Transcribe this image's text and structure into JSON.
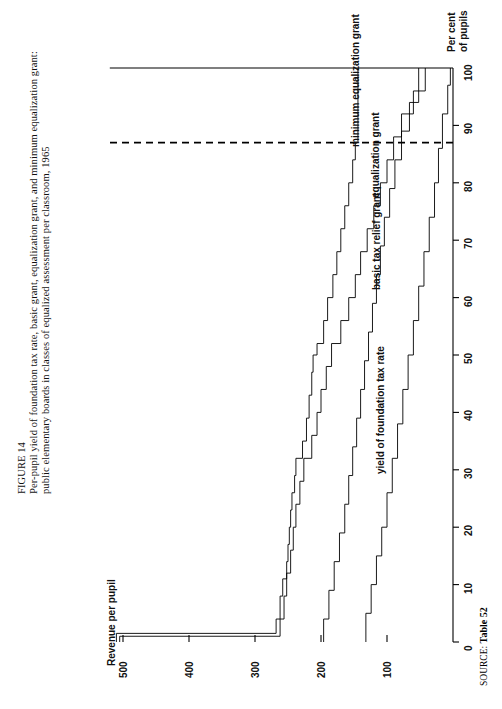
{
  "figure": {
    "number": "FIGURE 14",
    "caption_line_1": "Per-pupil yield of foundation tax rate, basic grant, equalization grant, and minimum equalization grant:",
    "caption_line_2": "public elementary boards in classes of equalized assessment per classroom, 1965",
    "source_label": "SOURCE:",
    "source_value": "Table 52"
  },
  "chart_data": {
    "type": "line",
    "title": "Per-pupil yield of foundation tax rate, basic grant, equalization grant, and minimum equalization grant: public elementary boards in classes of equalized assessment per classroom, 1965",
    "xlabel": "Per cent of pupils",
    "ylabel": "Revenue per pupil",
    "xlim": [
      0,
      100
    ],
    "ylim": [
      0,
      520
    ],
    "xticks": [
      0,
      10,
      20,
      30,
      40,
      50,
      60,
      70,
      80,
      90,
      100
    ],
    "xtick_labels": [
      "0",
      "10",
      "20",
      "30",
      "40",
      "50",
      "60",
      "70",
      "80",
      "90",
      "100"
    ],
    "yticks": [
      100,
      200,
      300,
      400,
      500
    ],
    "ytick_labels": [
      "100",
      "200",
      "300",
      "400",
      "500"
    ],
    "grid": false,
    "legend_position": "inline-annotations",
    "orientation": "rotated-90-ccw",
    "annotations": [
      {
        "text": "minimum equalization grant",
        "x": 87,
        "y": 150
      },
      {
        "text": "equalization grant",
        "x": 78,
        "y": 120
      },
      {
        "text": "basic tax relief grant",
        "x": 62,
        "y": 118
      },
      {
        "text": "yield of foundation tax rate",
        "x": 30,
        "y": 112
      }
    ],
    "reference_line": {
      "orientation": "vertical",
      "x": 87,
      "style": "dashed",
      "label": "minimum equalization grant cut-off"
    },
    "series": [
      {
        "name": "minimum equalization grant",
        "step": "post",
        "points": [
          [
            0,
            510
          ],
          [
            1.5,
            510
          ],
          [
            1.5,
            268
          ],
          [
            4.0,
            268
          ],
          [
            4.0,
            262
          ],
          [
            8.0,
            262
          ],
          [
            8.0,
            258
          ],
          [
            11.0,
            258
          ],
          [
            11.0,
            252
          ],
          [
            14.0,
            252
          ],
          [
            14.0,
            250
          ],
          [
            17.0,
            250
          ],
          [
            17.0,
            248
          ],
          [
            20.0,
            248
          ],
          [
            20.0,
            246
          ],
          [
            23.0,
            246
          ],
          [
            23.0,
            244
          ],
          [
            26.0,
            244
          ],
          [
            26.0,
            240
          ],
          [
            29.0,
            240
          ],
          [
            29.0,
            238
          ],
          [
            32.0,
            238
          ],
          [
            32.0,
            228
          ],
          [
            35.0,
            228
          ],
          [
            35.0,
            222
          ],
          [
            39.0,
            222
          ],
          [
            39.0,
            218
          ],
          [
            43.0,
            218
          ],
          [
            43.0,
            214
          ],
          [
            47.0,
            214
          ],
          [
            47.0,
            212
          ],
          [
            50.0,
            212
          ],
          [
            50.0,
            206
          ],
          [
            52.0,
            206
          ],
          [
            52.0,
            196
          ],
          [
            56.0,
            196
          ],
          [
            56.0,
            190
          ],
          [
            60.0,
            190
          ],
          [
            60.0,
            182
          ],
          [
            64.0,
            182
          ],
          [
            64.0,
            176
          ],
          [
            68.0,
            176
          ],
          [
            68.0,
            170
          ],
          [
            72.0,
            170
          ],
          [
            72.0,
            164
          ],
          [
            76.0,
            164
          ],
          [
            76.0,
            158
          ],
          [
            80.0,
            158
          ],
          [
            80.0,
            152
          ],
          [
            84.0,
            152
          ],
          [
            84.0,
            148
          ],
          [
            87.0,
            148
          ],
          [
            87.0,
            144
          ],
          [
            100,
            144
          ]
        ]
      },
      {
        "name": "equalization grant",
        "step": "post",
        "points": [
          [
            0,
            505
          ],
          [
            1.0,
            505
          ],
          [
            1.0,
            262
          ],
          [
            4.0,
            262
          ],
          [
            4.0,
            256
          ],
          [
            8.0,
            256
          ],
          [
            8.0,
            252
          ],
          [
            12.0,
            252
          ],
          [
            12.0,
            246
          ],
          [
            16.0,
            246
          ],
          [
            16.0,
            242
          ],
          [
            20.0,
            242
          ],
          [
            20.0,
            238
          ],
          [
            24.0,
            238
          ],
          [
            24.0,
            232
          ],
          [
            28.0,
            232
          ],
          [
            28.0,
            226
          ],
          [
            32.0,
            226
          ],
          [
            32.0,
            214
          ],
          [
            36.0,
            214
          ],
          [
            36.0,
            206
          ],
          [
            40.0,
            206
          ],
          [
            40.0,
            200
          ],
          [
            44.0,
            200
          ],
          [
            44.0,
            192
          ],
          [
            48.0,
            192
          ],
          [
            48.0,
            184
          ],
          [
            52.0,
            184
          ],
          [
            52.0,
            170
          ],
          [
            56.0,
            170
          ],
          [
            56.0,
            158
          ],
          [
            60.0,
            158
          ],
          [
            60.0,
            148
          ],
          [
            64.0,
            148
          ],
          [
            64.0,
            140
          ],
          [
            68.0,
            140
          ],
          [
            68.0,
            130
          ],
          [
            72.0,
            130
          ],
          [
            72.0,
            120
          ],
          [
            76.0,
            120
          ],
          [
            76.0,
            110
          ],
          [
            80.0,
            110
          ],
          [
            80.0,
            100
          ],
          [
            84.0,
            100
          ],
          [
            84.0,
            90
          ],
          [
            88.0,
            90
          ],
          [
            88.0,
            78
          ],
          [
            92.0,
            78
          ],
          [
            92.0,
            60
          ],
          [
            96.0,
            60
          ],
          [
            96.0,
            42
          ],
          [
            100,
            42
          ]
        ]
      },
      {
        "name": "basic tax relief grant",
        "step": "post",
        "points": [
          [
            0,
            196
          ],
          [
            4.0,
            196
          ],
          [
            4.0,
            188
          ],
          [
            9.0,
            188
          ],
          [
            9.0,
            180
          ],
          [
            14.0,
            180
          ],
          [
            14.0,
            172
          ],
          [
            19.0,
            172
          ],
          [
            19.0,
            164
          ],
          [
            24.0,
            164
          ],
          [
            24.0,
            158
          ],
          [
            29.0,
            158
          ],
          [
            29.0,
            152
          ],
          [
            34.0,
            152
          ],
          [
            34.0,
            146
          ],
          [
            39.0,
            146
          ],
          [
            39.0,
            140
          ],
          [
            44.0,
            140
          ],
          [
            44.0,
            134
          ],
          [
            49.0,
            134
          ],
          [
            49.0,
            128
          ],
          [
            54.0,
            128
          ],
          [
            54.0,
            122
          ],
          [
            59.0,
            122
          ],
          [
            59.0,
            116
          ],
          [
            64.0,
            116
          ],
          [
            64.0,
            110
          ],
          [
            69.0,
            110
          ],
          [
            69.0,
            104
          ],
          [
            74.0,
            104
          ],
          [
            74.0,
            96
          ],
          [
            79.0,
            96
          ],
          [
            79.0,
            88
          ],
          [
            84.0,
            88
          ],
          [
            84.0,
            78
          ],
          [
            89.0,
            78
          ],
          [
            89.0,
            66
          ],
          [
            94.0,
            66
          ],
          [
            94.0,
            52
          ],
          [
            100,
            52
          ]
        ]
      },
      {
        "name": "yield of foundation tax rate",
        "step": "post",
        "points": [
          [
            0,
            132
          ],
          [
            5.0,
            132
          ],
          [
            5.0,
            124
          ],
          [
            10.0,
            124
          ],
          [
            10.0,
            116
          ],
          [
            15.0,
            116
          ],
          [
            15.0,
            108
          ],
          [
            20.0,
            108
          ],
          [
            20.0,
            100
          ],
          [
            26.0,
            100
          ],
          [
            26.0,
            92
          ],
          [
            32.0,
            92
          ],
          [
            32.0,
            84
          ],
          [
            38.0,
            84
          ],
          [
            38.0,
            76
          ],
          [
            44.0,
            76
          ],
          [
            44.0,
            68
          ],
          [
            50.0,
            68
          ],
          [
            50.0,
            60
          ],
          [
            56.0,
            60
          ],
          [
            56.0,
            52
          ],
          [
            62.0,
            52
          ],
          [
            62.0,
            44
          ],
          [
            68.0,
            44
          ],
          [
            68.0,
            36
          ],
          [
            74.0,
            36
          ],
          [
            74.0,
            28
          ],
          [
            80.0,
            28
          ],
          [
            80.0,
            22
          ],
          [
            86.0,
            22
          ],
          [
            86.0,
            16
          ],
          [
            92.0,
            16
          ],
          [
            92.0,
            8
          ],
          [
            97.0,
            8
          ],
          [
            97.0,
            4
          ],
          [
            100,
            4
          ]
        ]
      }
    ]
  },
  "axes": {
    "y_title": "Revenue per pupil",
    "x_title_line_1": "Per cent",
    "x_title_line_2": "of pupils"
  },
  "curve_labels": {
    "minimum_equalization_grant": "minimum equalization grant",
    "equalization_grant": "equalization grant",
    "basic_tax_relief_grant": "basic tax relief grant",
    "yield_of_foundation_tax_rate": "yield of foundation tax rate"
  },
  "colors": {
    "ink": "#000000",
    "paper": "#ffffff"
  }
}
